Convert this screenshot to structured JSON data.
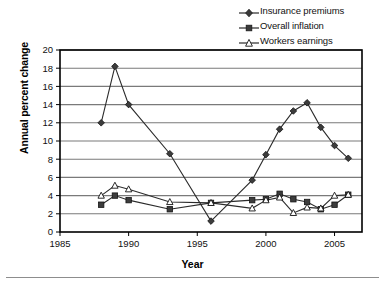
{
  "chart_data": {
    "type": "line",
    "title": "",
    "xlabel": "Year",
    "ylabel": "Annual percent change",
    "xlim": [
      1985,
      2007
    ],
    "ylim": [
      0,
      20
    ],
    "xticks": [
      1985,
      1990,
      1995,
      2000,
      2005
    ],
    "yticks": [
      0,
      2,
      4,
      6,
      8,
      10,
      12,
      14,
      16,
      18,
      20
    ],
    "grid": "horizontal",
    "legend_position": "top-right",
    "series": [
      {
        "name": "Insurance premiums",
        "marker": "diamond-filled",
        "color": "#2b2b2b",
        "x": [
          1988,
          1989,
          1990,
          1993,
          1996,
          1999,
          2000,
          2001,
          2002,
          2003,
          2004,
          2005,
          2006
        ],
        "values": [
          12.0,
          18.2,
          14.0,
          8.6,
          1.2,
          5.7,
          8.5,
          11.3,
          13.3,
          14.2,
          11.5,
          9.5,
          8.1
        ]
      },
      {
        "name": "Overall inflation",
        "marker": "square-filled",
        "color": "#2b2b2b",
        "x": [
          1988,
          1989,
          1990,
          1993,
          1996,
          1999,
          2000,
          2001,
          2002,
          2003,
          2004,
          2005,
          2006
        ],
        "values": [
          3.0,
          4.0,
          3.5,
          2.5,
          3.2,
          3.5,
          3.6,
          4.2,
          3.6,
          3.3,
          2.5,
          3.0,
          4.1
        ]
      },
      {
        "name": "Workers earnings",
        "marker": "triangle-open",
        "color": "#2b2b2b",
        "x": [
          1988,
          1989,
          1990,
          1993,
          1996,
          1999,
          2000,
          2001,
          2002,
          2003,
          2004,
          2005,
          2006
        ],
        "values": [
          4.0,
          5.1,
          4.7,
          3.3,
          3.2,
          2.6,
          3.5,
          3.8,
          2.1,
          2.7,
          2.6,
          4.0,
          4.1
        ]
      }
    ]
  },
  "legend": {
    "items": [
      {
        "label": "Insurance premiums"
      },
      {
        "label": "Overall inflation"
      },
      {
        "label": "Workers earnings"
      }
    ]
  },
  "axes": {
    "y_title": "Annual percent change",
    "x_title": "Year"
  },
  "colors": {
    "ink": "#2b2b2b",
    "gridline": "#7a7a7a",
    "frame": "#000000",
    "background": "#ffffff"
  }
}
